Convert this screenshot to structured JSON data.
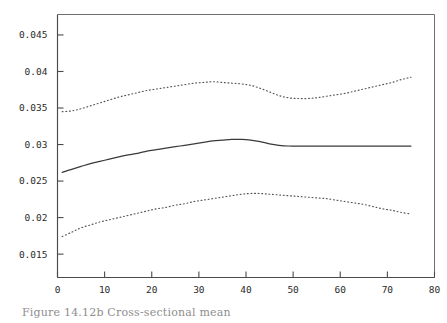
{
  "figure": {
    "caption": "Figure 14.12b   Cross-sectional mean",
    "background_color": "#ffffff",
    "frame_color": "#6f6f6f",
    "axis_color": "#4a4a4a"
  },
  "chart_data": {
    "type": "line",
    "title": "",
    "subtitle": "",
    "xlabel": "",
    "ylabel": "",
    "xlim": [
      0,
      80
    ],
    "ylim": [
      0.0118,
      0.0478
    ],
    "grid": false,
    "legend": false,
    "legend_position": "none",
    "xticks": [
      0,
      10,
      20,
      30,
      40,
      50,
      60,
      70,
      80
    ],
    "xtick_labels": [
      "0",
      "10",
      "20",
      "30",
      "40",
      "50",
      "60",
      "70",
      "80"
    ],
    "yticks": [
      0.015,
      0.02,
      0.025,
      0.03,
      0.035,
      0.04,
      0.045
    ],
    "ytick_labels": [
      "0.015",
      "0.02",
      "0.025",
      "0.03",
      "0.035",
      "0.04",
      "0.045"
    ],
    "x": [
      1,
      3,
      5,
      7,
      9,
      11,
      13,
      15,
      17,
      19,
      21,
      23,
      25,
      27,
      29,
      31,
      33,
      35,
      37,
      39,
      41,
      43,
      45,
      47,
      49,
      51,
      53,
      55,
      57,
      59,
      61,
      63,
      65,
      67,
      69,
      71,
      73,
      75
    ],
    "series": [
      {
        "name": "upper-band",
        "style": "dotted",
        "color": "#555555",
        "values": [
          0.0345,
          0.0346,
          0.0349,
          0.0353,
          0.0357,
          0.0361,
          0.0365,
          0.0368,
          0.0371,
          0.0374,
          0.0376,
          0.0378,
          0.038,
          0.0382,
          0.0384,
          0.0385,
          0.0386,
          0.0385,
          0.0384,
          0.0383,
          0.0381,
          0.0377,
          0.0372,
          0.0367,
          0.0364,
          0.0363,
          0.0363,
          0.0364,
          0.0366,
          0.0368,
          0.037,
          0.0373,
          0.0376,
          0.0379,
          0.0382,
          0.0385,
          0.0389,
          0.0392
        ]
      },
      {
        "name": "mean",
        "style": "solid",
        "color": "#3a3a3a",
        "values": [
          0.0262,
          0.0266,
          0.027,
          0.0274,
          0.0277,
          0.028,
          0.0283,
          0.0286,
          0.0288,
          0.0291,
          0.0293,
          0.0295,
          0.0297,
          0.0299,
          0.0301,
          0.0303,
          0.0305,
          0.0306,
          0.0307,
          0.0307,
          0.0306,
          0.0304,
          0.0301,
          0.0299,
          0.0298,
          0.0298,
          0.0298,
          0.0298,
          0.0298,
          0.0298,
          0.0298,
          0.0298,
          0.0298,
          0.0298,
          0.0298,
          0.0298,
          0.0298,
          0.0298
        ]
      },
      {
        "name": "lower-band",
        "style": "dotted",
        "color": "#555555",
        "values": [
          0.0174,
          0.018,
          0.0186,
          0.019,
          0.0194,
          0.0197,
          0.02,
          0.0203,
          0.0206,
          0.0209,
          0.0212,
          0.0214,
          0.0217,
          0.0219,
          0.0222,
          0.0224,
          0.0226,
          0.0228,
          0.023,
          0.0232,
          0.0233,
          0.0233,
          0.0232,
          0.0231,
          0.023,
          0.0229,
          0.0228,
          0.0227,
          0.0226,
          0.0224,
          0.0222,
          0.022,
          0.0218,
          0.0215,
          0.0212,
          0.021,
          0.0207,
          0.0205
        ]
      }
    ]
  }
}
